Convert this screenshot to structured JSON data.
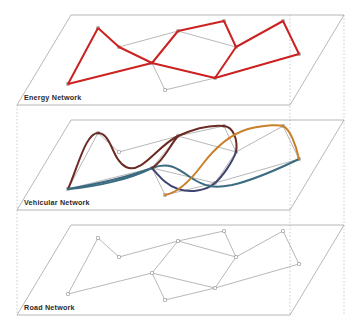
{
  "figure": {
    "type": "multilayer-network-diagram",
    "title": "",
    "background_color": "#ffffff",
    "width": 361,
    "height": 323
  },
  "layers": [
    {
      "id": "energy",
      "label": "Energy Network",
      "order": 1,
      "y_offset": 0,
      "overlay_color": "#cc2222",
      "overlay_style": "polyline",
      "overlay_width": 2.0
    },
    {
      "id": "vehicular",
      "label": "Vehicular Network",
      "order": 2,
      "y_offset": 105,
      "overlay_style": "curves",
      "overlay_colors": [
        "#6b2a22",
        "#3f4470",
        "#c8812a",
        "#3a6b80"
      ],
      "overlay_width": 2.0
    },
    {
      "id": "road",
      "label": "Road Network",
      "order": 3,
      "y_offset": 210,
      "overlay_color": "#9a9a9a",
      "overlay_style": "base-graph",
      "overlay_width": 0.7
    }
  ],
  "plane": {
    "stroke": "#9a9a9a",
    "stroke_width": 0.7,
    "fill": "none",
    "corners": [
      [
        71,
        15
      ],
      [
        344,
        15
      ],
      [
        290,
        105
      ],
      [
        17,
        105
      ]
    ],
    "guide_stroke": "#b5b5b5",
    "guide_dash": "1.5,2",
    "guides_x": [
      17,
      290,
      344
    ],
    "label_pos": [
      24,
      100
    ]
  },
  "graph": {
    "node_marker": "square",
    "node_size": 2.6,
    "node_stroke": "#8a8a8a",
    "node_fill": "#ffffff",
    "edge_stroke": "#9a9a9a",
    "edge_width": 0.7,
    "node_count": 11,
    "edge_count": 14,
    "nodes": [
      {
        "id": 0,
        "name": "n0",
        "x": 98,
        "y": 28
      },
      {
        "id": 1,
        "name": "n1",
        "x": 119,
        "y": 47
      },
      {
        "id": 2,
        "name": "n2",
        "x": 68,
        "y": 84
      },
      {
        "id": 3,
        "name": "n3",
        "x": 152,
        "y": 63
      },
      {
        "id": 4,
        "name": "n4",
        "x": 178,
        "y": 31
      },
      {
        "id": 5,
        "name": "n5",
        "x": 224,
        "y": 21
      },
      {
        "id": 6,
        "name": "n6",
        "x": 236,
        "y": 47
      },
      {
        "id": 7,
        "name": "n7",
        "x": 165,
        "y": 90
      },
      {
        "id": 8,
        "name": "n8",
        "x": 215,
        "y": 78
      },
      {
        "id": 9,
        "name": "n9",
        "x": 283,
        "y": 21
      },
      {
        "id": 10,
        "name": "n10",
        "x": 299,
        "y": 54
      }
    ],
    "edges": [
      {
        "from": 2,
        "to": 0
      },
      {
        "from": 0,
        "to": 1
      },
      {
        "from": 1,
        "to": 4
      },
      {
        "from": 2,
        "to": 3
      },
      {
        "from": 3,
        "to": 4
      },
      {
        "from": 4,
        "to": 5
      },
      {
        "from": 5,
        "to": 6
      },
      {
        "from": 4,
        "to": 6
      },
      {
        "from": 3,
        "to": 7
      },
      {
        "from": 3,
        "to": 8
      },
      {
        "from": 7,
        "to": 8
      },
      {
        "from": 8,
        "to": 6
      },
      {
        "from": 6,
        "to": 9
      },
      {
        "from": 9,
        "to": 10
      },
      {
        "from": 8,
        "to": 10
      }
    ]
  },
  "energy_overlay": {
    "color": "#cc2222",
    "stroke_width": 2.0,
    "paths": [
      [
        [
          68,
          84
        ],
        [
          98,
          28
        ],
        [
          119,
          47
        ],
        [
          152,
          63
        ],
        [
          68,
          84
        ]
      ],
      [
        [
          152,
          63
        ],
        [
          178,
          31
        ],
        [
          224,
          21
        ],
        [
          236,
          47
        ],
        [
          215,
          78
        ],
        [
          152,
          63
        ]
      ],
      [
        [
          236,
          47
        ],
        [
          283,
          21
        ],
        [
          299,
          54
        ],
        [
          215,
          78
        ]
      ]
    ]
  },
  "vehicular_overlay": {
    "stroke_width": 2.0,
    "curves": [
      {
        "color": "#6b2a22",
        "name": "flow-a",
        "d": "M 68 84 C 78 62 86 26 99 28 C 112 30 112 55 126 62 C 142 70 158 40 178 31 C 200 21 214 20 224 21 C 234 22 238 36 236 47"
      },
      {
        "color": "#3f4470",
        "name": "flow-b",
        "d": "M 236 47 C 232 58 222 72 215 78 C 206 86 190 88 178 84 C 166 80 160 72 152 63"
      },
      {
        "color": "#3a6b80",
        "name": "flow-c",
        "d": "M 68 84 C 92 80 128 72 152 63 C 168 57 176 62 190 72 C 206 83 216 83 232 80 C 258 74 282 62 299 54"
      },
      {
        "color": "#c8812a",
        "name": "flow-d",
        "d": "M 165 90 C 178 88 190 76 202 60 C 214 44 228 30 248 24 C 268 19 280 20 283 21 C 290 24 296 40 299 54"
      },
      {
        "color": "#3a6b80",
        "name": "flow-e",
        "d": "M 68 84 C 96 82 130 74 152 63"
      },
      {
        "color": "#6b2a22",
        "name": "flow-f",
        "d": "M 152 63 C 164 56 170 40 178 31"
      }
    ]
  }
}
